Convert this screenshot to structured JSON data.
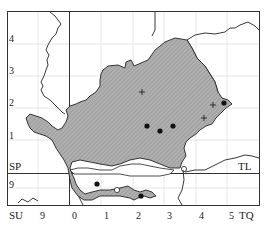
{
  "map": {
    "grid_squares": [
      "SP",
      "TL",
      "SU",
      "TQ"
    ],
    "labels": {
      "sp": "SP",
      "tl": "TL",
      "su": "SU",
      "tq": "TQ"
    },
    "y_ticks": [
      "4",
      "3",
      "2",
      "1",
      "9"
    ],
    "x_ticks": [
      "9",
      "0",
      "1",
      "2",
      "3",
      "4",
      "5"
    ],
    "symbols": {
      "dots": 7,
      "crosses": 4,
      "open_circles": 2
    },
    "colors": {
      "region_fill": "#a8a8a8",
      "boundary": "#222222",
      "grid": "#e4e4e4",
      "frame": "#333333"
    }
  }
}
